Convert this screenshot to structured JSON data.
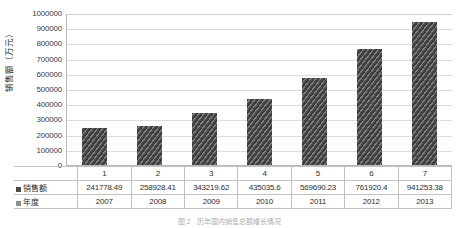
{
  "chart_data": {
    "type": "bar",
    "title": "",
    "xlabel": "",
    "ylabel": "销售额（万元）",
    "categories": [
      "1",
      "2",
      "3",
      "4",
      "5",
      "6",
      "7"
    ],
    "values": [
      241778.49,
      258928.41,
      343219.62,
      435035.6,
      569690.23,
      761920.4,
      941253.38
    ],
    "value_labels": [
      "241778.49",
      "258928.41",
      "343219.62",
      "435035.6",
      "569690.23",
      "761920.4",
      "941253.38"
    ],
    "years": [
      "2007",
      "2008",
      "2009",
      "2010",
      "2011",
      "2012",
      "2013"
    ],
    "ylim": [
      0,
      1000000
    ],
    "ytick_values": [
      1000000,
      900000,
      800000,
      700000,
      600000,
      500000,
      400000,
      300000,
      200000,
      100000,
      0
    ],
    "ytick_labels": [
      "1000000",
      "900000",
      "800000",
      "700000",
      "600000",
      "500000",
      "400000",
      "300000",
      "200000",
      "100000",
      "0"
    ],
    "grid": true,
    "legend_position": "data-table",
    "series": [
      {
        "name": "销售额",
        "values": [
          241778.49,
          258928.41,
          343219.62,
          435035.6,
          569690.23,
          761920.4,
          941253.38
        ]
      },
      {
        "name": "年度",
        "values": [
          "2007",
          "2008",
          "2009",
          "2010",
          "2011",
          "2012",
          "2013"
        ]
      }
    ],
    "bar_color": "#4a4a4a",
    "grid_color": "#dcdcdc",
    "axis_color": "#b8b8b8"
  },
  "data_table": {
    "row_labels": [
      "销售额",
      "年度"
    ],
    "category_row": [
      "1",
      "2",
      "3",
      "4",
      "5",
      "6",
      "7"
    ],
    "sales_row": [
      "241778.49",
      "258928.41",
      "343219.62",
      "435035.6",
      "569690.23",
      "761920.4",
      "941253.38"
    ],
    "year_row": [
      "2007",
      "2008",
      "2009",
      "2010",
      "2011",
      "2012",
      "2013"
    ]
  },
  "caption": {
    "text": "图 2　历年国内销售总额增长情况"
  }
}
